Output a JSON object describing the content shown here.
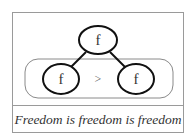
{
  "diagram": {
    "top_node": {
      "label": "f"
    },
    "left_node": {
      "label": "f"
    },
    "right_node": {
      "label": "f"
    },
    "comparison_operator": ">"
  },
  "caption": "Freedom is freedom is freedom",
  "colors": {
    "border": "#9a9a9a",
    "stroke": "#111111",
    "group_border": "#8a8a8a",
    "text": "#333333"
  }
}
